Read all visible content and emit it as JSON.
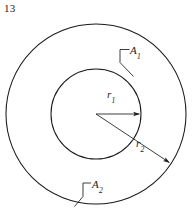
{
  "figure": {
    "number": "13",
    "type": "annulus-diagram",
    "background_color": "#ffffff",
    "stroke_color": "#1a1a1a",
    "text_color": "#1a1a1a",
    "geometry": {
      "center_x": 96,
      "center_y": 114,
      "outer_radius": 90,
      "inner_radius": 45
    },
    "shapes": [
      {
        "name": "outer-circle",
        "label": "A2",
        "radius": 90
      },
      {
        "name": "inner-circle",
        "label": "A1",
        "radius": 45
      }
    ],
    "labels": {
      "area_outer": {
        "base": "A",
        "sub": "2"
      },
      "area_inner": {
        "base": "A",
        "sub": "1"
      },
      "radius_inner": {
        "base": "r",
        "sub": "1"
      },
      "radius_outer": {
        "base": "r",
        "sub": "2"
      }
    },
    "arrows": [
      {
        "name": "inner-radius-arrow",
        "label": "r1",
        "from": [
          96,
          114
        ],
        "to": [
          140,
          114
        ],
        "angle_deg": 0
      },
      {
        "name": "outer-radius-arrow",
        "label": "r2",
        "from": [
          96,
          114
        ],
        "to": [
          170,
          163
        ],
        "angle_deg": 33.5
      }
    ],
    "leaders": [
      {
        "name": "a1-leader",
        "label": "A1",
        "points": [
          [
            128,
            50
          ],
          [
            119,
            50
          ],
          [
            119,
            62
          ],
          [
            133,
            76
          ]
        ]
      },
      {
        "name": "a2-leader",
        "label": "A2",
        "points": [
          [
            90,
            183
          ],
          [
            82,
            183
          ],
          [
            82,
            196
          ],
          [
            75,
            206
          ]
        ]
      }
    ]
  }
}
